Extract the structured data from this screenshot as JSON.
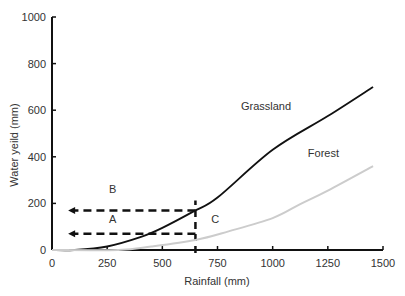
{
  "chart_data": {
    "type": "line",
    "title": "",
    "xlabel": "Rainfall (mm)",
    "ylabel": "Water yeild (mm)",
    "xlim": [
      0,
      1500
    ],
    "ylim": [
      0,
      1000
    ],
    "xticks": [
      0,
      250,
      500,
      750,
      1000,
      1250,
      1500
    ],
    "yticks": [
      0,
      200,
      400,
      600,
      800,
      1000
    ],
    "grid": false,
    "legend": "none (inline curve labels)",
    "series": [
      {
        "name": "Grassland",
        "color": "#111111",
        "x": [
          100,
          250,
          400,
          500,
          650,
          750,
          1000,
          1250,
          1455
        ],
        "y": [
          0,
          15,
          55,
          95,
          170,
          225,
          430,
          575,
          700
        ]
      },
      {
        "name": "Forest",
        "color": "#cccccc",
        "x": [
          300,
          450,
          650,
          800,
          1000,
          1125,
          1250,
          1455
        ],
        "y": [
          0,
          15,
          43,
          80,
          137,
          197,
          255,
          360
        ]
      }
    ],
    "annotations": [
      {
        "text": "Grassland",
        "x": 970,
        "y": 600
      },
      {
        "text": "Forest",
        "x": 1230,
        "y": 400
      },
      {
        "text": "B",
        "x": 275,
        "y": 245
      },
      {
        "text": "A",
        "x": 275,
        "y": 115
      },
      {
        "text": "C",
        "x": 740,
        "y": 115
      }
    ],
    "reference_lines": [
      {
        "type": "vertical-dashed",
        "x": 650,
        "y_from": 0,
        "y_to": 170
      },
      {
        "type": "horizontal-dashed-arrow",
        "y": 170,
        "x_from": 650,
        "x_to": 55,
        "label": "B"
      },
      {
        "type": "horizontal-dashed-arrow",
        "y": 70,
        "x_from": 650,
        "x_to": 55,
        "label": "A"
      }
    ]
  }
}
